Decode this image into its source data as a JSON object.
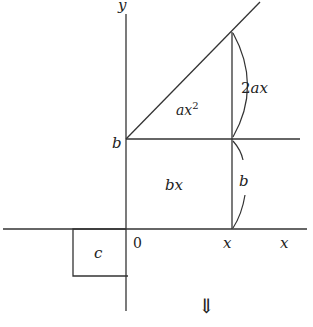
{
  "diagram": {
    "axes": {
      "x_label": "x",
      "y_label": "y",
      "origin_label": "0"
    },
    "y_intercept_label": "b",
    "x_tick_label": "x",
    "regions": {
      "triangle": "ax",
      "triangle_exp": "2",
      "rectangle": "bx",
      "square": "c"
    },
    "braces": {
      "upper": "2ax",
      "lower": "b"
    },
    "arrow": "⇓",
    "colors": {
      "line": "#333333",
      "background": "#ffffff"
    }
  }
}
